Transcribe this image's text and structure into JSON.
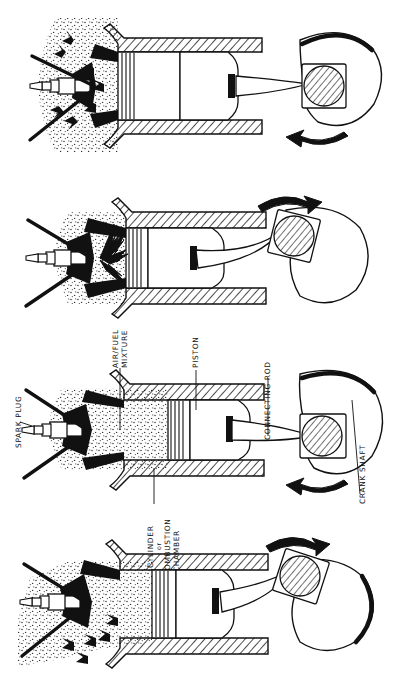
{
  "figure": {
    "background_color": "#ffffff",
    "ink_color": "#111111",
    "style": "line drawing with hatching and stipple shading",
    "orientation": "labels rotated 90 degrees counter-clockwise"
  },
  "labels": {
    "spark_plug": "SPARK PLUG",
    "air_fuel_line1": "AIR/FUEL",
    "air_fuel_line2": "MIXTURE",
    "piston": "PISTON",
    "cylinder_line1": "CYLINDER",
    "cylinder_line2": "or",
    "cylinder_line3": "COMBUSTION",
    "cylinder_line4": "CHAMBER",
    "connecting_rod": "CONNECTING  ROD",
    "crank_shaft": "CRANK SHAFT"
  },
  "panels": [
    {
      "index": 1,
      "stroke_name": "exhaust",
      "piston_position": "moving up",
      "valve_state": "exhaust valve open",
      "chamber_fill": "stipple",
      "arrow_style": "solid triangular arrows flowing outward",
      "arrow_count": 7,
      "crank_rotation": "clockwise",
      "rotation_arrow": "curved arrow pointing left"
    },
    {
      "index": 2,
      "stroke_name": "power",
      "piston_position": "pushed down",
      "valve_state": "valves closed",
      "chamber_fill": "stipple with burning gases",
      "arrow_style": "zigzag lightning spark arrows from plug",
      "arrow_count": 4,
      "crank_rotation": "clockwise",
      "rotation_arrow": "curved arrow pointing right"
    },
    {
      "index": 3,
      "stroke_name": "compression",
      "piston_position": "moving up",
      "valve_state": "valves closed",
      "chamber_fill": "dense stipple compressed mixture",
      "arrow_style": "none",
      "arrow_count": 0,
      "crank_rotation": "clockwise",
      "rotation_arrow": "curved arrow pointing left"
    },
    {
      "index": 4,
      "stroke_name": "intake",
      "piston_position": "moving down",
      "valve_state": "intake valve open",
      "chamber_fill": "stipple entering mixture",
      "arrow_style": "solid triangular arrows flowing inward",
      "arrow_count": 5,
      "crank_rotation": "clockwise",
      "rotation_arrow": "curved arrow pointing right"
    }
  ],
  "components": {
    "spark_plug": "segmented electrode body with hex nut",
    "cylinder_head": "hatched cross section",
    "piston": "with four piston rings",
    "connecting_rod": "tapered rod from piston pin to crank pin",
    "crank_pin": "diagonally hatched circle",
    "crank_web": "counterweight lobe with heavy outline"
  }
}
